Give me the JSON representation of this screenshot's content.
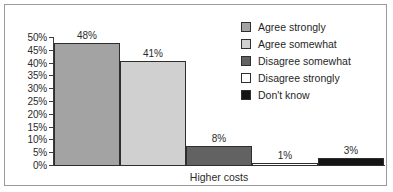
{
  "chart_data": {
    "type": "bar",
    "title": "",
    "subtitle": "",
    "xlabel": "Higher costs",
    "ylabel": "",
    "categories": [
      "Agree strongly",
      "Agree somewhat",
      "Disagree somewhat",
      "Disagree strongly",
      "Don't know"
    ],
    "values": [
      48,
      41,
      8,
      1,
      3
    ],
    "data_labels": [
      "48%",
      "41%",
      "8%",
      "1%",
      "3%"
    ],
    "bar_colors": [
      "#a3a3a3",
      "#d0d0d0",
      "#626262",
      "#ffffff",
      "#141414"
    ],
    "bar_border_color": "#2e2e2e",
    "ylim": [
      0,
      50
    ],
    "ytick_values": [
      50,
      45,
      40,
      35,
      30,
      25,
      20,
      15,
      10,
      5,
      0
    ],
    "ytick_labels": [
      "50%",
      "45%",
      "40%",
      "35%",
      "30%",
      "25%",
      "20%",
      "15%",
      "10%",
      "5%",
      "0%"
    ],
    "grid": false,
    "legend_position": "upper-right",
    "legend": [
      {
        "label": "Agree strongly",
        "color": "#a3a3a3"
      },
      {
        "label": "Agree somewhat",
        "color": "#d0d0d0"
      },
      {
        "label": "Disagree somewhat",
        "color": "#626262"
      },
      {
        "label": "Disagree strongly",
        "color": "#ffffff"
      },
      {
        "label": "Don't know",
        "color": "#141414"
      }
    ]
  },
  "frame": {
    "border_color": "#9a9a9a",
    "background": "#ffffff"
  },
  "axis": {
    "line_color": "#3b3b3b"
  }
}
